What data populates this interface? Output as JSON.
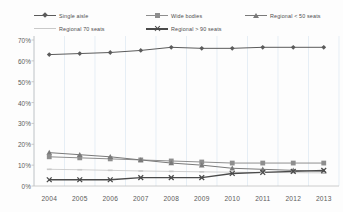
{
  "chart_data": {
    "type": "line",
    "title": "",
    "subtitle": "",
    "xlabel": "",
    "ylabel": "",
    "x": [
      "2004",
      "2005",
      "2006",
      "2007",
      "2008",
      "2009",
      "2010",
      "2011",
      "2012",
      "2013"
    ],
    "categories": [
      "2004",
      "2005",
      "2006",
      "2007",
      "2008",
      "2009",
      "2010",
      "2011",
      "2012",
      "2013"
    ],
    "ylim": [
      0,
      70
    ],
    "ytick_labels": [
      "0%",
      "10%",
      "20%",
      "30%",
      "40%",
      "50%",
      "60%",
      "70%"
    ],
    "ytick_values": [
      0,
      10,
      20,
      30,
      40,
      50,
      60,
      70
    ],
    "grid": "vertical",
    "legend_position": "top",
    "units": "percent",
    "series": [
      {
        "name": "Single aisle",
        "marker": "diamond",
        "color": "#5b5b5b",
        "values": [
          63,
          63.5,
          64,
          65,
          66.5,
          66,
          66,
          66.5,
          66.5,
          66.5
        ]
      },
      {
        "name": "Wide bodies",
        "marker": "square",
        "color": "#8e8e8e",
        "values": [
          14,
          13.5,
          13,
          12.5,
          12,
          11.5,
          11,
          11,
          11,
          11
        ]
      },
      {
        "name": "Regional < 50 seats",
        "marker": "triangle",
        "color": "#7a7a7a",
        "values": [
          16,
          15,
          14,
          12.5,
          11,
          10,
          8.5,
          8,
          7.5,
          7
        ]
      },
      {
        "name": "Regional 70 seats",
        "marker": "dash",
        "color": "#c9c9c9",
        "values": [
          8,
          7.8,
          7.5,
          7.2,
          7,
          6.8,
          6.6,
          6.5,
          6.4,
          6.3
        ]
      },
      {
        "name": "Regional > 90 seats",
        "marker": "cross",
        "color": "#4a4a4a",
        "values": [
          3,
          3,
          3,
          4,
          4,
          4,
          6,
          6.5,
          7,
          7.5
        ]
      }
    ]
  },
  "legend": {
    "items": [
      {
        "label": "Single aisle",
        "marker": "diamond",
        "color": "#5b5b5b"
      },
      {
        "label": "Wide bodies",
        "marker": "square",
        "color": "#8e8e8e"
      },
      {
        "label": "Regional < 50 seats",
        "marker": "triangle",
        "color": "#7a7a7a"
      },
      {
        "label": "Regional 70 seats",
        "marker": "dash",
        "color": "#c9c9c9"
      },
      {
        "label": "Regional > 90 seats",
        "marker": "cross",
        "color": "#4a4a4a"
      }
    ]
  },
  "axes": {
    "y_ticks": [
      "70%",
      "60%",
      "50%",
      "40%",
      "30%",
      "20%",
      "10%",
      "0%"
    ],
    "x_ticks": [
      "2004",
      "2005",
      "2006",
      "2007",
      "2008",
      "2009",
      "2010",
      "2011",
      "2012",
      "2013"
    ]
  },
  "colors": {
    "grid": "#dbe6f0",
    "axis": "#bfbfbf",
    "text": "#595959",
    "background": "#fdfdfd"
  }
}
